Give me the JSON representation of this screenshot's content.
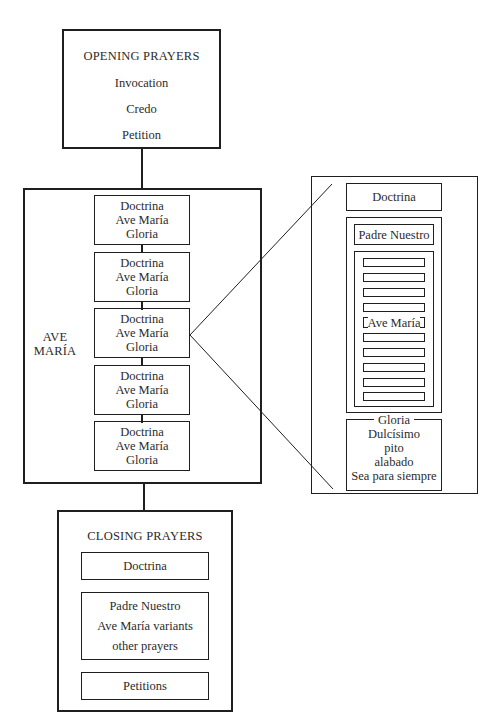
{
  "opening": {
    "title": "OPENING PRAYERS",
    "items": [
      "Invocation",
      "Credo",
      "Petition"
    ]
  },
  "ave_maria": {
    "label_line1": "AVE",
    "label_line2": "MARÍA",
    "decades": [
      {
        "lines": [
          "Doctrina",
          "Ave María",
          "Gloria"
        ]
      },
      {
        "lines": [
          "Doctrina",
          "Ave María",
          "Gloria"
        ]
      },
      {
        "lines": [
          "Doctrina",
          "Ave María",
          "Gloria"
        ]
      },
      {
        "lines": [
          "Doctrina",
          "Ave María",
          "Gloria"
        ]
      },
      {
        "lines": [
          "Doctrina",
          "Ave María",
          "Gloria"
        ]
      }
    ],
    "expanded_index": 2
  },
  "detail": {
    "doctrina": "Doctrina",
    "padre_nuestro": "Padre Nuestro",
    "ave_maria_label": "Ave María",
    "bars_before": 4,
    "bars_after": 5,
    "gloria_lines": [
      "Gloria",
      "Dulcísimo",
      "pito",
      "alabado",
      "Sea para siempre"
    ]
  },
  "closing": {
    "title": "CLOSING PRAYERS",
    "doctrina": "Doctrina",
    "middle_lines": [
      "Padre Nuestro",
      "Ave María variants",
      "other prayers"
    ],
    "petitions": "Petitions"
  },
  "colors": {
    "stroke": "#1f1f1f",
    "text": "#2b2b2b",
    "background": "#ffffff"
  }
}
